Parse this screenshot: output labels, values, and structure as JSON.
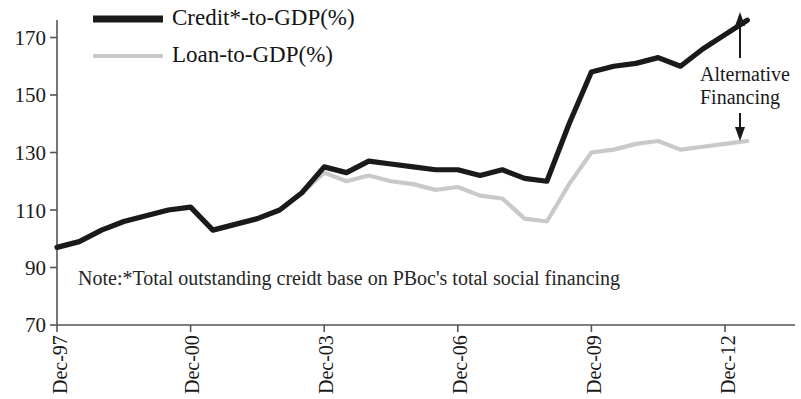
{
  "chart_data": {
    "type": "line",
    "title": "",
    "xlabel": "",
    "ylabel": "",
    "ylim": [
      70,
      180
    ],
    "y_ticks": [
      70,
      90,
      110,
      130,
      150,
      170
    ],
    "x_ticks": [
      "Dec-97",
      "Dec-00",
      "Dec-03",
      "Dec-06",
      "Dec-09",
      "Dec-12"
    ],
    "grid": false,
    "legend_position": "top-left",
    "x_start": "Dec-97",
    "x_end": "Dec-13",
    "series": [
      {
        "name": "Credit*-to-GDP(%)",
        "color": "#1a1a1a",
        "x": [
          "Dec-97",
          "Jun-98",
          "Dec-98",
          "Jun-99",
          "Dec-99",
          "Jun-00",
          "Dec-00",
          "Jun-01",
          "Dec-01",
          "Jun-02",
          "Dec-02",
          "Jun-03",
          "Dec-03",
          "Jun-04",
          "Dec-04",
          "Jun-05",
          "Dec-05",
          "Jun-06",
          "Dec-06",
          "Jun-07",
          "Dec-07",
          "Jun-08",
          "Dec-08",
          "Jun-09",
          "Dec-09",
          "Jun-10",
          "Dec-10",
          "Jun-11",
          "Dec-11",
          "Jun-12",
          "Dec-12",
          "Jun-13"
        ],
        "values": [
          97,
          99,
          103,
          106,
          108,
          110,
          111,
          103,
          105,
          107,
          110,
          116,
          125,
          123,
          127,
          126,
          125,
          124,
          124,
          122,
          124,
          121,
          120,
          140,
          158,
          160,
          161,
          163,
          160,
          166,
          171,
          176
        ]
      },
      {
        "name": "Loan-to-GDP(%)",
        "color": "#c9c9c9",
        "x": [
          "Dec-97",
          "Jun-98",
          "Dec-98",
          "Jun-99",
          "Dec-99",
          "Jun-00",
          "Dec-00",
          "Jun-01",
          "Dec-01",
          "Jun-02",
          "Dec-02",
          "Jun-03",
          "Dec-03",
          "Jun-04",
          "Dec-04",
          "Jun-05",
          "Dec-05",
          "Jun-06",
          "Dec-06",
          "Jun-07",
          "Dec-07",
          "Jun-08",
          "Dec-08",
          "Jun-09",
          "Dec-09",
          "Jun-10",
          "Dec-10",
          "Jun-11",
          "Dec-11",
          "Jun-12",
          "Dec-12",
          "Jun-13"
        ],
        "values": [
          97,
          99,
          103,
          106,
          108,
          110,
          111,
          103,
          105,
          107,
          110,
          116,
          123,
          120,
          122,
          120,
          119,
          117,
          118,
          115,
          114,
          107,
          106,
          119,
          130,
          131,
          133,
          134,
          131,
          132,
          133,
          134
        ]
      }
    ],
    "annotations": [
      {
        "name": "alternative-financing",
        "text_line1": "Alternative",
        "text_line2": "Financing",
        "arrow": "double-headed-vertical"
      }
    ],
    "note": "Note:*Total outstanding creidt base on PBoc's total social financing"
  },
  "legend": {
    "items": [
      {
        "label": "Credit*-to-GDP(%)",
        "style": "solid-thick-black"
      },
      {
        "label": "Loan-to-GDP(%)",
        "style": "solid-thin-gray"
      }
    ]
  },
  "axes": {
    "y_tick_labels": [
      "170",
      "150",
      "130",
      "110",
      "90",
      "70"
    ],
    "x_tick_labels": [
      "Dec-97",
      "Dec-00",
      "Dec-03",
      "Dec-06",
      "Dec-09",
      "Dec-12"
    ]
  },
  "colors": {
    "credit_line": "#1a1a1a",
    "loan_line": "#c9c9c9",
    "axis": "#555555",
    "text": "#1a1a1a",
    "background": "#ffffff"
  }
}
